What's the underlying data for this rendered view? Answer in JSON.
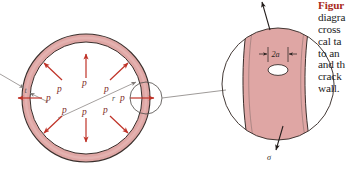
{
  "figure": {
    "kind": "engineering-diagram",
    "colors": {
      "wall_fill": "#dfa6a4",
      "wall_fill_light": "#e7b8b5",
      "outline": "#3a2f2c",
      "pressure_arrow": "#bf3227",
      "pressure_label": "#7d2b27",
      "leader_gray": "#8d8885",
      "caption_heading": "#a92a21",
      "caption_body": "#1b1b1b",
      "stress_arrow": "#221c1a"
    },
    "vessel": {
      "name": "spherical-pressure-vessel-cross-section",
      "radius_label": "r",
      "thickness_label": "t",
      "pressure_label": "p",
      "pressure_arrow_count": 8,
      "pressure_labels": [
        "p",
        "p",
        "p",
        "p",
        "p",
        "p",
        "p",
        "p"
      ]
    },
    "detail": {
      "name": "crack-detail-view",
      "crack_length_label": "2a",
      "stress_label_top": "σ",
      "stress_label_bottom": "σ",
      "description": "enlarged circular detail of the vessel wall showing an elliptical through-crack of length 2a under tensile stress sigma"
    }
  },
  "caption": {
    "heading": "Figur",
    "lines": [
      "diagra",
      "cross",
      "cal ta",
      "to an",
      "and th",
      "crack",
      "wall."
    ]
  }
}
